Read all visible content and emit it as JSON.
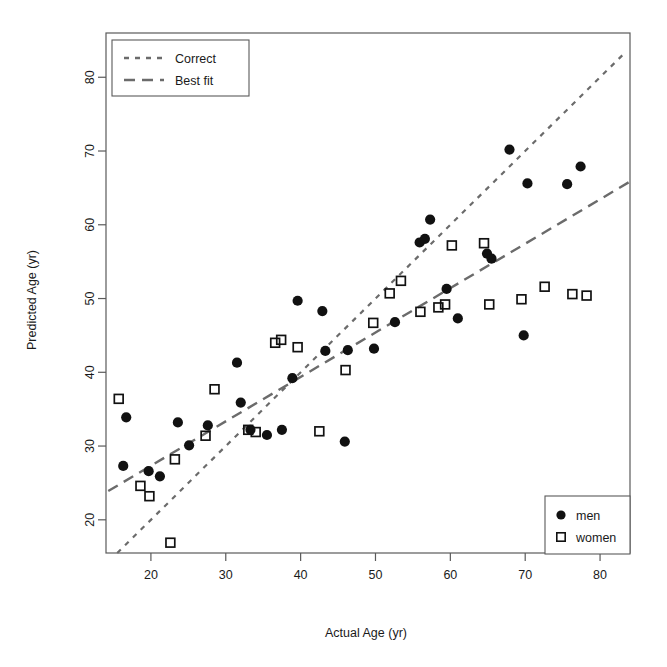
{
  "chart_data": {
    "type": "scatter",
    "title": "",
    "xlabel": "Actual Age (yr)",
    "ylabel": "Predicted Age (yr)",
    "xlim": [
      14,
      84
    ],
    "ylim": [
      15.5,
      86
    ],
    "xticks": [
      20,
      30,
      40,
      50,
      60,
      70,
      80
    ],
    "yticks": [
      20,
      30,
      40,
      50,
      60,
      70,
      80
    ],
    "xtick_labels": [
      "20",
      "30",
      "40",
      "50",
      "60",
      "70",
      "80"
    ],
    "ytick_labels": [
      "20",
      "30",
      "40",
      "50",
      "60",
      "70",
      "80"
    ],
    "grid": false,
    "legends": [
      {
        "name": "line-legend",
        "position": "top-left",
        "entries": [
          {
            "label": "Correct",
            "style": "dotted"
          },
          {
            "label": "Best fit",
            "style": "dashed"
          }
        ]
      },
      {
        "name": "series-legend",
        "position": "bottom-right",
        "entries": [
          {
            "label": "men",
            "marker": "filled-circle"
          },
          {
            "label": "women",
            "marker": "open-square"
          }
        ]
      }
    ],
    "lines": [
      {
        "name": "Correct",
        "style": "dotted",
        "description": "identity line y = x",
        "slope": 1.0,
        "intercept": 0.0,
        "x_start": 15.5,
        "y_start": 15.5,
        "x_end": 83.5,
        "y_end": 83.5,
        "color": "#6b6b6b"
      },
      {
        "name": "Best fit",
        "style": "dashed",
        "description": "regression line of predicted age on actual age",
        "slope": 0.6,
        "intercept": 15.3,
        "x_start": 14.3,
        "y_start": 23.9,
        "x_end": 83.9,
        "y_end": 65.8,
        "color": "#6b6b6b"
      }
    ],
    "series": [
      {
        "name": "men",
        "marker": "filled-circle",
        "color": "#111111",
        "points": [
          [
            16.7,
            33.9
          ],
          [
            16.3,
            27.3
          ],
          [
            19.7,
            26.6
          ],
          [
            21.2,
            25.9
          ],
          [
            23.6,
            33.2
          ],
          [
            25.1,
            30.1
          ],
          [
            27.6,
            32.8
          ],
          [
            31.5,
            41.3
          ],
          [
            32.0,
            35.9
          ],
          [
            33.3,
            32.2
          ],
          [
            35.5,
            31.5
          ],
          [
            37.5,
            32.2
          ],
          [
            38.9,
            39.2
          ],
          [
            39.6,
            49.7
          ],
          [
            42.9,
            48.3
          ],
          [
            43.3,
            42.9
          ],
          [
            45.9,
            30.6
          ],
          [
            46.3,
            43.0
          ],
          [
            49.8,
            43.2
          ],
          [
            52.6,
            46.8
          ],
          [
            55.9,
            57.6
          ],
          [
            56.6,
            58.1
          ],
          [
            57.3,
            60.7
          ],
          [
            59.5,
            51.3
          ],
          [
            61.0,
            47.3
          ],
          [
            64.9,
            56.1
          ],
          [
            65.5,
            55.4
          ],
          [
            67.9,
            70.2
          ],
          [
            69.8,
            45.0
          ],
          [
            70.3,
            65.6
          ],
          [
            75.6,
            65.5
          ],
          [
            77.4,
            67.9
          ]
        ]
      },
      {
        "name": "women",
        "marker": "open-square",
        "color": "#111111",
        "points": [
          [
            15.7,
            36.4
          ],
          [
            18.6,
            24.6
          ],
          [
            19.8,
            23.2
          ],
          [
            22.6,
            16.9
          ],
          [
            23.2,
            28.2
          ],
          [
            27.3,
            31.4
          ],
          [
            28.5,
            37.7
          ],
          [
            33.0,
            32.2
          ],
          [
            34.0,
            31.9
          ],
          [
            36.6,
            44.0
          ],
          [
            37.4,
            44.4
          ],
          [
            39.6,
            43.4
          ],
          [
            42.5,
            32.0
          ],
          [
            46.0,
            40.3
          ],
          [
            49.7,
            46.7
          ],
          [
            51.9,
            50.7
          ],
          [
            53.4,
            52.4
          ],
          [
            56.0,
            48.2
          ],
          [
            58.4,
            48.8
          ],
          [
            59.3,
            49.2
          ],
          [
            60.2,
            57.2
          ],
          [
            64.5,
            57.5
          ],
          [
            65.2,
            49.2
          ],
          [
            69.5,
            49.9
          ],
          [
            72.6,
            51.6
          ],
          [
            76.3,
            50.6
          ],
          [
            78.2,
            50.4
          ]
        ]
      }
    ]
  }
}
